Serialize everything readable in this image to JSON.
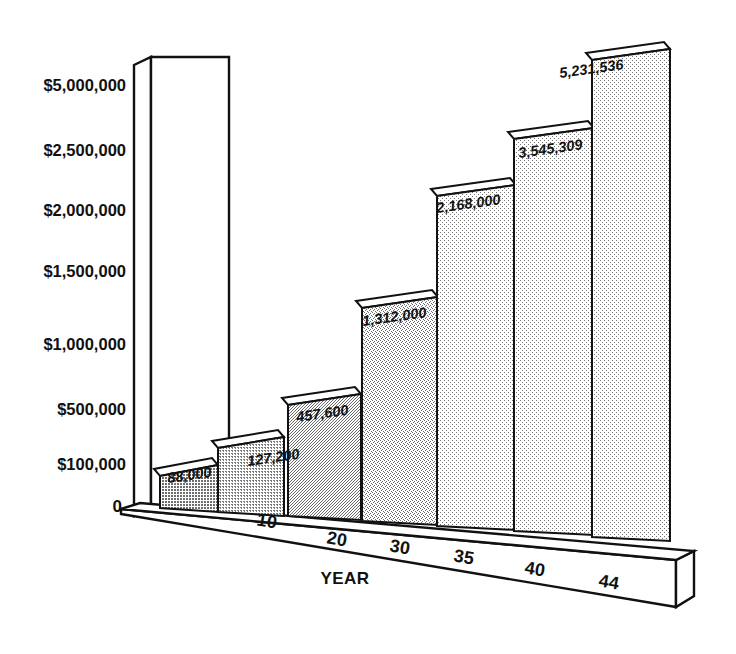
{
  "chart_data": {
    "type": "bar",
    "title": "",
    "subtitle": "",
    "xlabel": "YEAR",
    "ylabel": "",
    "categories": [
      "",
      "10",
      "20",
      "30",
      "35",
      "40",
      "44"
    ],
    "values": [
      88000,
      127200,
      457600,
      1312000,
      2168000,
      3545309,
      5231536
    ],
    "value_labels": [
      "88,000",
      "127,200",
      "457,600",
      "1,312,000",
      "2,168,000",
      "3,545,309",
      "5,231,536"
    ],
    "ytick_labels": [
      "$5,000,000",
      "$2,500,000",
      "$2,000,000",
      "$1,500,000",
      "$1,000,000",
      "$500,000",
      "$100,000",
      "0"
    ],
    "ytick_values": [
      5000000,
      2500000,
      2000000,
      1500000,
      1000000,
      500000,
      100000,
      0
    ],
    "xtick_labels": [
      "10",
      "20",
      "30",
      "35",
      "40",
      "44"
    ],
    "ylim": [
      0,
      5231536
    ],
    "grid": false,
    "legend": false,
    "legend_position": "none",
    "style": "3d-isometric-halftone"
  },
  "axis": {
    "y_ticks": [
      {
        "label": "$5,000,000",
        "y": 91
      },
      {
        "label": "$2,500,000",
        "y": 156
      },
      {
        "label": "$2,000,000",
        "y": 216
      },
      {
        "label": "$1,500,000",
        "y": 277
      },
      {
        "label": "$1,000,000",
        "y": 350
      },
      {
        "label": "$500,000",
        "y": 415
      },
      {
        "label": "$100,000",
        "y": 470
      },
      {
        "label": "0",
        "y": 512
      }
    ],
    "x_ticks": [
      {
        "label": "10",
        "x": 266,
        "y": 527
      },
      {
        "label": "20",
        "x": 336,
        "y": 545
      },
      {
        "label": "30",
        "x": 399,
        "y": 553
      },
      {
        "label": "35",
        "x": 463,
        "y": 563
      },
      {
        "label": "40",
        "x": 534,
        "y": 575
      },
      {
        "label": "44",
        "x": 608,
        "y": 588
      }
    ],
    "title": {
      "label": "YEAR",
      "x": 345,
      "y": 584
    }
  },
  "bars": [
    {
      "name": "bar-1",
      "label": "88,000",
      "label_x": 168,
      "label_y": 483,
      "x": 160,
      "w": 58,
      "top": 465,
      "base": 508,
      "skew": 11,
      "fill": "#9a9a9a"
    },
    {
      "name": "bar-2",
      "label": "127,200",
      "label_x": 248,
      "label_y": 466,
      "x": 218,
      "w": 66,
      "top": 437,
      "base": 512,
      "skew": 11,
      "fill": "#b4b4b4"
    },
    {
      "name": "bar-3",
      "label": "457,600",
      "label_x": 297,
      "label_y": 422,
      "x": 288,
      "w": 73,
      "top": 394,
      "base": 516,
      "skew": 11,
      "fill": "#bdbdbd"
    },
    {
      "name": "bar-4",
      "label": "1,312,000",
      "label_x": 363,
      "label_y": 326,
      "x": 362,
      "w": 76,
      "top": 297,
      "base": 521,
      "skew": 11,
      "fill": "#c4c4c4"
    },
    {
      "name": "bar-5",
      "label": "2,168,000",
      "label_x": 437,
      "label_y": 213,
      "x": 437,
      "w": 79,
      "top": 185,
      "base": 526,
      "skew": 11,
      "fill": "#c9c9c9"
    },
    {
      "name": "bar-6",
      "label": "3,545,309",
      "label_x": 519,
      "label_y": 158,
      "x": 514,
      "w": 80,
      "top": 128,
      "base": 531,
      "skew": 11,
      "fill": "#d2d2d2"
    },
    {
      "name": "bar-7",
      "label": "5,231,536",
      "label_x": 560,
      "label_y": 78,
      "x": 592,
      "w": 78,
      "top": 49,
      "base": 537,
      "skew": 11,
      "fill": "#cecece"
    }
  ],
  "colors": {
    "ink": "#111111",
    "background": "#ffffff",
    "bar_darkest": "#9a9a9a",
    "bar_lightest": "#d2d2d2"
  }
}
